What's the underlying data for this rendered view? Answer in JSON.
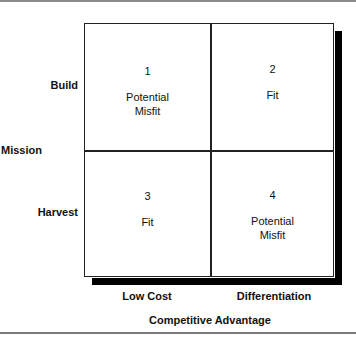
{
  "diagram": {
    "type": "2x2 matrix",
    "y_axis": {
      "title": "Mission",
      "rows": [
        "Build",
        "Harvest"
      ]
    },
    "x_axis": {
      "title": "Competitive Advantage",
      "columns": [
        "Low Cost",
        "Differentiation"
      ]
    },
    "quadrants": [
      {
        "number": "1",
        "line1": "Potential",
        "line2": "Misfit"
      },
      {
        "number": "2",
        "line1": "Fit",
        "line2": ""
      },
      {
        "number": "3",
        "line1": "Fit",
        "line2": ""
      },
      {
        "number": "4",
        "line1": "Potential",
        "line2": "Misfit"
      }
    ],
    "colors": {
      "border": "#222222",
      "shadow": "#000000",
      "rule": "#8a8a8a",
      "background": "#ffffff"
    }
  }
}
